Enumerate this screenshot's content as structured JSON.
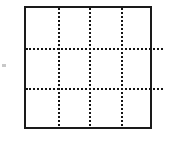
{
  "figure": {
    "title": "",
    "frame": {
      "name": "outer-square",
      "x": 24,
      "y": 6,
      "width": 128,
      "height": 123,
      "border_color": "#1a1a1a",
      "border_width_px": 2.5,
      "fill_color": "#ffffff"
    },
    "grid": {
      "style": "dotted",
      "color": "#141414",
      "thickness_px": 2,
      "columns": 4,
      "rows": 4,
      "vertical_lines": [
        {
          "name": "vertical-gridline-1",
          "offset_px": 32
        },
        {
          "name": "vertical-gridline-2",
          "offset_px": 63
        },
        {
          "name": "vertical-gridline-3",
          "offset_px": 95
        }
      ],
      "horizontal_lines": [
        {
          "name": "horizontal-gridline-1",
          "offset_px": 40,
          "overhang_right_px": 14
        },
        {
          "name": "horizontal-gridline-2",
          "offset_px": 80,
          "overhang_right_px": 14
        }
      ]
    },
    "margin_mark": {
      "name": "left-edge-tick",
      "color": "#c8c8c8",
      "visible": true
    },
    "background_color": "#ffffff"
  }
}
